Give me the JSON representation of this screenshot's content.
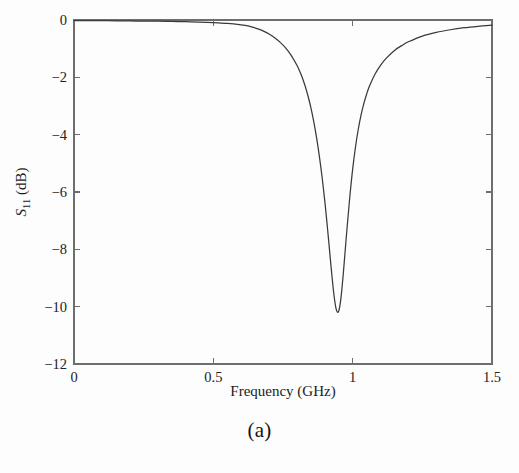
{
  "figure": {
    "caption": "(a)",
    "background_color": "#fdfdfd",
    "curve_color": "#3a3a3a",
    "axis_color": "#6e6e6e"
  },
  "chart_data": {
    "type": "line",
    "title": "",
    "xlabel": "Frequency (GHz)",
    "ylabel": "S11 (dB)",
    "ylabel_base": "S",
    "ylabel_sub": "11",
    "ylabel_unit": "(dB)",
    "xlim": [
      0,
      1.5
    ],
    "ylim": [
      -12,
      0
    ],
    "xticks": [
      0,
      0.5,
      1,
      1.5
    ],
    "xtick_labels": [
      "0",
      "0.5",
      "1",
      "1.5"
    ],
    "yticks": [
      0,
      -2,
      -4,
      -6,
      -8,
      -10,
      -12
    ],
    "ytick_labels": [
      "0",
      "-2",
      "-4",
      "-6",
      "-8",
      "-10",
      "-12"
    ],
    "grid": false,
    "legend": null,
    "resonance": {
      "center_frequency_ghz": 0.935,
      "minimum_db": -10.2
    },
    "series": [
      {
        "name": "S11",
        "x": [
          0.0,
          0.05,
          0.1,
          0.15,
          0.2,
          0.25,
          0.3,
          0.35,
          0.4,
          0.45,
          0.5,
          0.55,
          0.58,
          0.6,
          0.62,
          0.64,
          0.66,
          0.68,
          0.7,
          0.72,
          0.74,
          0.76,
          0.78,
          0.8,
          0.81,
          0.82,
          0.83,
          0.84,
          0.85,
          0.86,
          0.87,
          0.88,
          0.89,
          0.9,
          0.905,
          0.91,
          0.915,
          0.92,
          0.925,
          0.93,
          0.935,
          0.94,
          0.945,
          0.95,
          0.955,
          0.96,
          0.965,
          0.97,
          0.98,
          0.99,
          1.0,
          1.01,
          1.02,
          1.03,
          1.04,
          1.05,
          1.06,
          1.08,
          1.1,
          1.12,
          1.15,
          1.18,
          1.2,
          1.25,
          1.3,
          1.35,
          1.4,
          1.45,
          1.5
        ],
        "y": [
          -0.02,
          -0.02,
          -0.02,
          -0.03,
          -0.03,
          -0.04,
          -0.04,
          -0.05,
          -0.06,
          -0.07,
          -0.09,
          -0.12,
          -0.14,
          -0.17,
          -0.2,
          -0.25,
          -0.31,
          -0.39,
          -0.49,
          -0.62,
          -0.78,
          -0.98,
          -1.24,
          -1.58,
          -1.79,
          -2.03,
          -2.32,
          -2.66,
          -3.06,
          -3.53,
          -4.08,
          -4.72,
          -5.46,
          -6.32,
          -6.8,
          -7.3,
          -7.82,
          -8.35,
          -8.86,
          -9.35,
          -9.75,
          -10.05,
          -10.19,
          -10.15,
          -9.92,
          -9.52,
          -9.0,
          -8.42,
          -7.24,
          -6.14,
          -5.2,
          -4.44,
          -3.82,
          -3.32,
          -2.92,
          -2.59,
          -2.31,
          -1.89,
          -1.58,
          -1.34,
          -1.06,
          -0.87,
          -0.76,
          -0.56,
          -0.43,
          -0.34,
          -0.27,
          -0.22,
          -0.18
        ]
      }
    ]
  }
}
